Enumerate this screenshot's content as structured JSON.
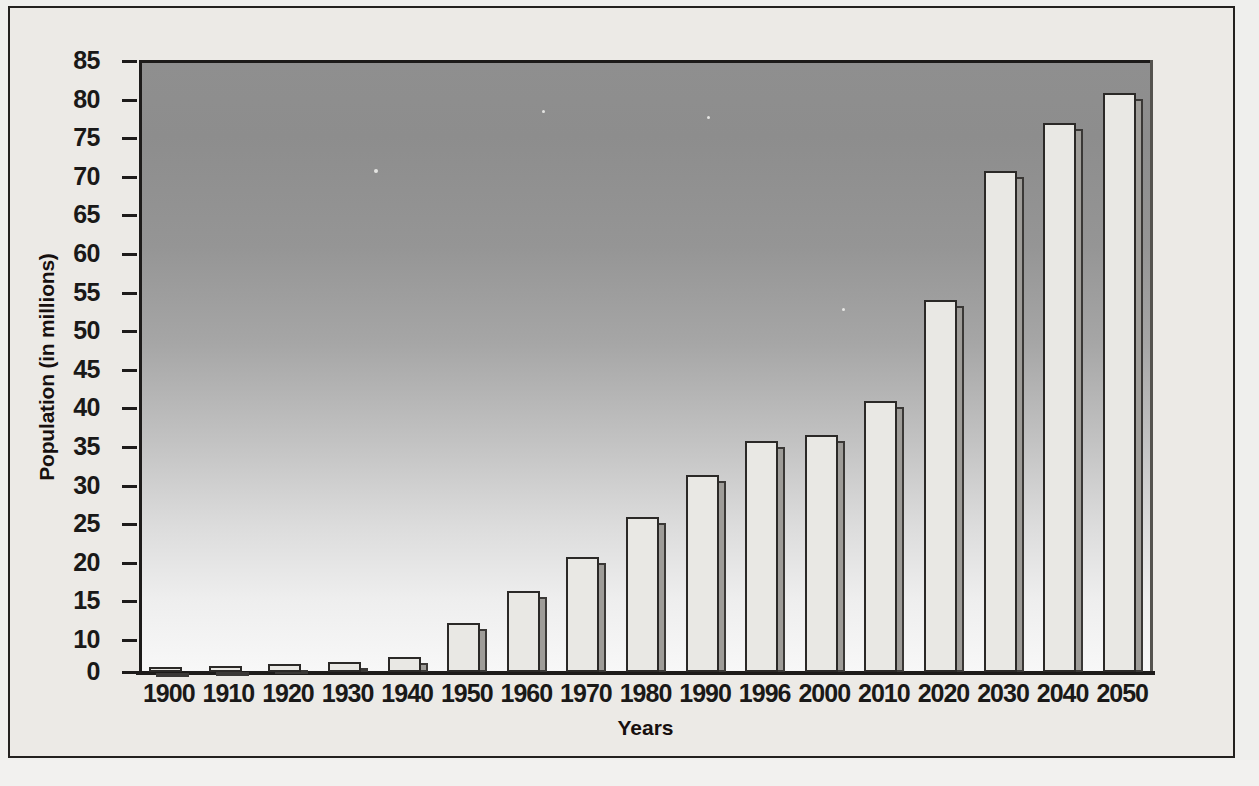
{
  "figure": {
    "background_color": "#efefed",
    "frame_border_color": "#23211f",
    "plot_gradient_top": "#8f8f8f",
    "plot_gradient_bottom": "#f8f8f8",
    "bar_face_color": "#e9e8e4",
    "bar_edge_color": "#2b2927",
    "bar_shadow_color": "#9e9c98"
  },
  "chart_data": {
    "type": "bar",
    "title": "",
    "xlabel": "Years",
    "ylabel": "Population (in millions)",
    "categories": [
      "1900",
      "1910",
      "1920",
      "1930",
      "1940",
      "1950",
      "1960",
      "1970",
      "1980",
      "1990",
      "1996",
      "2000",
      "2010",
      "2020",
      "2030",
      "2040",
      "2050"
    ],
    "values": [
      1.5,
      1.9,
      2.6,
      3.2,
      4.8,
      12.2,
      16.4,
      20.7,
      25.9,
      31.4,
      35.8,
      36.5,
      41.0,
      54.0,
      70.8,
      77.0,
      80.8
    ],
    "ylim": [
      0,
      85
    ],
    "ytick_values": [
      0,
      10,
      15,
      20,
      25,
      30,
      35,
      40,
      45,
      50,
      55,
      60,
      65,
      70,
      75,
      80,
      85
    ],
    "ytick_labels": [
      "0",
      "10",
      "15",
      "20",
      "25",
      "30",
      "35",
      "40",
      "45",
      "50",
      "55",
      "60",
      "65",
      "70",
      "75",
      "80",
      "85"
    ],
    "grid": false,
    "legend": false,
    "legend_position": "none",
    "series": [
      {
        "name": "Population",
        "values": [
          1.5,
          1.9,
          2.6,
          3.2,
          4.8,
          12.2,
          16.4,
          20.7,
          25.9,
          31.4,
          35.8,
          36.5,
          41.0,
          54.0,
          70.8,
          77.0,
          80.8
        ]
      }
    ]
  }
}
